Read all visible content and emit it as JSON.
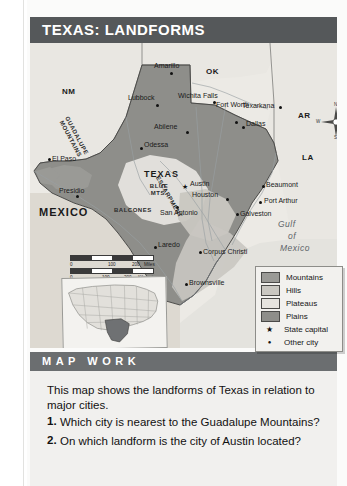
{
  "title": "TEXAS: LANDFORMS",
  "map": {
    "states": [
      "NM",
      "OK",
      "AR",
      "LA",
      "TEXAS",
      "MEXICO"
    ],
    "water_labels": [
      "Gulf",
      "of",
      "Mexico"
    ],
    "features": [
      "GUADALUPE MOUNTAINS",
      "BLUE MTS.",
      "BALCONES",
      "ESCARPMENT"
    ],
    "rivers": [
      "Red River",
      "Rio Grande",
      "Pecos River",
      "Sabine River",
      "Colorado River",
      "Brazos River"
    ],
    "capital": "Austin",
    "cities": [
      "Amarillo",
      "Lubbock",
      "Wichita Falls",
      "Fort Worth",
      "Texarkana",
      "Dallas",
      "Abilene",
      "Odessa",
      "El Paso",
      "Presidio",
      "Austin",
      "San Antonio",
      "Houston",
      "Beaumont",
      "Port Arthur",
      "Galveston",
      "Laredo",
      "Corpus Christi",
      "Brownsville"
    ],
    "compass": {
      "n": "N",
      "s": "S",
      "e": "E",
      "w": "W"
    },
    "scale": {
      "miles_ticks": [
        "0",
        "100",
        "200"
      ],
      "miles_unit": "Miles",
      "km_ticks": [
        "0",
        "100",
        "200"
      ],
      "km_unit": "Kilometers"
    },
    "inset_alt": "United States locator map with Texas highlighted"
  },
  "legend": {
    "items": [
      {
        "label": "Mountains",
        "type": "swatch",
        "color": "#9a9a96"
      },
      {
        "label": "Hills",
        "type": "swatch",
        "color": "#c9c7c1"
      },
      {
        "label": "Plateaus",
        "type": "swatch",
        "color": "#e6e4df"
      },
      {
        "label": "Plains",
        "type": "swatch",
        "color": "#8e8e8a"
      },
      {
        "label": "State capital",
        "type": "star",
        "glyph": "★"
      },
      {
        "label": "Other city",
        "type": "dot",
        "glyph": "●"
      }
    ]
  },
  "mapwork": {
    "heading": "MAP WORK",
    "intro": "This map shows the landforms of Texas in relation to major cities.",
    "questions": [
      {
        "num": "1.",
        "text": "Which city is nearest to the Guadalupe Mountains?"
      },
      {
        "num": "2.",
        "text": "On which landform is the city of Austin located?"
      }
    ]
  },
  "colors": {
    "title_bar": "#55585a",
    "mapwork_bar": "#6b6e70",
    "page": "#fbfbfa",
    "map_bg": "#eceae5",
    "plains": "#8e8e8a",
    "hills": "#c9c7c1",
    "plateaus": "#e6e4df",
    "mountains": "#9a9a96"
  }
}
